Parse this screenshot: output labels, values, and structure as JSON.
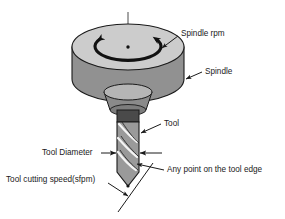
{
  "figure": {
    "background_color": "#ffffff",
    "line_color": "#1a1a1a"
  },
  "colors": {
    "spindle_top_face": "#cccccc",
    "spindle_body": "#919191",
    "collar_face": "#b5b5b5",
    "collar_body": "#8a8a8a",
    "shank": "#4a4a4a",
    "tool_body": "#9a9a9a",
    "flute_highlight": "#f2f2f2",
    "outline": "#1a1a1a"
  },
  "labels": [
    {
      "id": "spindle-rpm",
      "text": "Spindle rpm",
      "x": 181,
      "y": 34,
      "anchor": "start"
    },
    {
      "id": "spindle",
      "text": "Spindle",
      "x": 205,
      "y": 72,
      "anchor": "start"
    },
    {
      "id": "tool",
      "text": "Tool",
      "x": 164,
      "y": 124,
      "anchor": "start"
    },
    {
      "id": "tool-diameter",
      "text": "Tool Diameter",
      "x": 42,
      "y": 153,
      "anchor": "start"
    },
    {
      "id": "any-point-on-tool-edge",
      "text": "Any point on the tool edge",
      "x": 167,
      "y": 170,
      "anchor": "start"
    },
    {
      "id": "tool-cutting-speed",
      "text": "Tool cutting speed(sfpm)",
      "x": 6,
      "y": 180,
      "anchor": "start"
    }
  ],
  "geometry": {
    "spindle": {
      "center_x": 128,
      "top_ellipse_cy": 47,
      "rx": 56,
      "ry": 23,
      "body_height": 32
    },
    "rotation_arrow": {
      "direction": "counter-clockwise",
      "rx": 33,
      "ry": 14
    },
    "tool": {
      "shank_top_y": 118,
      "tip_y": 186,
      "half_width": 11,
      "flute_count": 3
    }
  }
}
